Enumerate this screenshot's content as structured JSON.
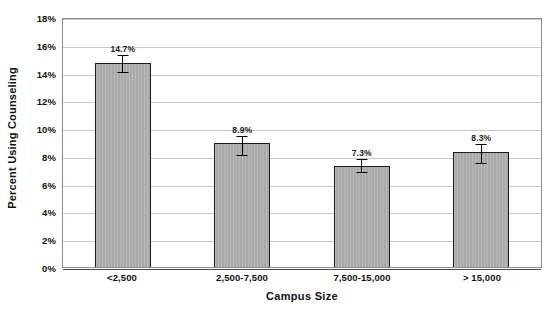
{
  "chart_data": {
    "type": "bar",
    "title": "",
    "xlabel": "Campus Size",
    "ylabel": "Percent Using Counseling",
    "categories": [
      "<2,500",
      "2,500-7,500",
      "7,500-15,000",
      "> 15,000"
    ],
    "values": [
      14.7,
      8.9,
      7.3,
      8.3
    ],
    "data_labels": [
      "14.7%",
      "8.9%",
      "7.3%",
      "8.3%"
    ],
    "errors_upper": [
      0.55,
      0.55,
      0.5,
      0.55
    ],
    "errors_lower": [
      0.75,
      0.9,
      0.55,
      0.9
    ],
    "ylim": [
      0,
      18
    ],
    "ytick_labels": [
      "18%",
      "16%",
      "14%",
      "12%",
      "10%",
      "8%",
      "6%",
      "4%",
      "2%",
      "0%"
    ],
    "ytick_values": [
      18,
      16,
      14,
      12,
      10,
      8,
      6,
      4,
      2,
      0
    ],
    "grid": true,
    "legend": "none",
    "bar_color": "#a9a9a9",
    "bar_edge_color": "#1b1b1b",
    "gridline_color": "#c9c9c9",
    "axis_color": "#8d8d8d",
    "text_color": "#111111"
  }
}
